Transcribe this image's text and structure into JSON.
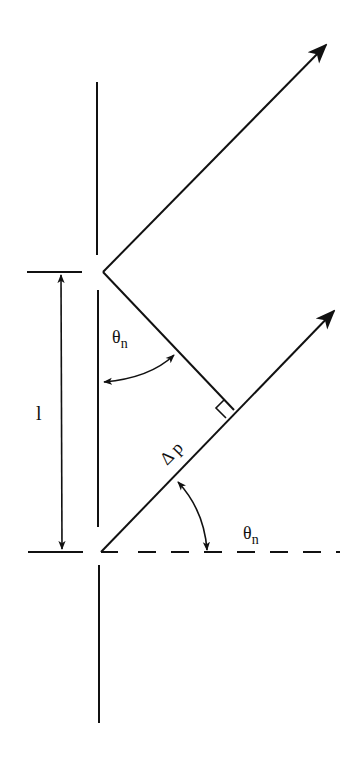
{
  "diagram": {
    "type": "diffraction-grating-geometry",
    "colors": {
      "stroke": "#111111",
      "background": "#ffffff"
    },
    "labels": {
      "spacing": "l",
      "angle_upper_symbol": "θ",
      "angle_upper_subscript": "n",
      "path_difference": "Δ p",
      "angle_lower_symbol": "θ",
      "angle_lower_subscript": "n"
    },
    "elements": [
      "grating-barrier (vertical line with two slits)",
      "diffracted-ray-upper (arrow)",
      "diffracted-ray-lower (arrow)",
      "perpendicular-foot (right-angle mark)",
      "dimension-arrow l",
      "normal dashed reference line"
    ]
  }
}
